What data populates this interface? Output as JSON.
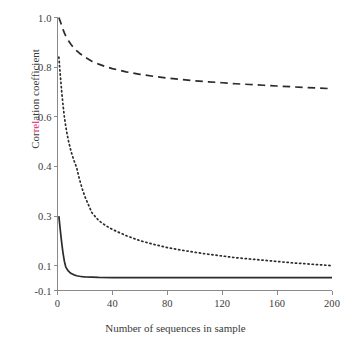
{
  "chart_data": {
    "type": "line",
    "title": "",
    "xlabel": "Number of sequences in sample",
    "ylabel": "Correlation coefficient",
    "ylabel_tinted_fragment": "rel",
    "tint_color": "#d6246e",
    "line_color": "#2b2b2b",
    "axis_color": "#8a8a8a",
    "background": "#ffffff",
    "grid": false,
    "legend": "none",
    "xlim": [
      0,
      200
    ],
    "ylim": [
      -0.1,
      1.0
    ],
    "xticks": [
      0,
      40,
      80,
      120,
      160,
      200
    ],
    "xtick_labels": [
      "0",
      "40",
      "80",
      "120",
      "160",
      "200"
    ],
    "yticks": [
      1.0,
      0.8,
      0.6,
      0.4,
      0.3,
      0.1,
      -0.1
    ],
    "ytick_labels": [
      "1.0",
      "0.8",
      "0.6",
      "0.4",
      "0.3",
      "0.1",
      "-0.1"
    ],
    "ytick_fractions": [
      1.0,
      0.8181818,
      0.6363636,
      0.4545455,
      0.2727273,
      0.0909091,
      0.0
    ],
    "series": [
      {
        "name": "dashed-curve",
        "style": "dashed",
        "x": [
          1,
          2,
          3,
          4,
          5,
          6,
          8,
          10,
          13,
          16,
          20,
          25,
          30,
          35,
          40,
          50,
          60,
          70,
          80,
          90,
          100,
          110,
          120,
          130,
          140,
          150,
          160,
          170,
          180,
          190,
          200
        ],
        "y": [
          1.0,
          0.985,
          0.968,
          0.952,
          0.938,
          0.926,
          0.906,
          0.89,
          0.871,
          0.856,
          0.84,
          0.824,
          0.812,
          0.802,
          0.794,
          0.781,
          0.771,
          0.763,
          0.756,
          0.75,
          0.745,
          0.741,
          0.737,
          0.733,
          0.73,
          0.727,
          0.724,
          0.721,
          0.718,
          0.716,
          0.713
        ]
      },
      {
        "name": "dotted-curve",
        "style": "dotted",
        "x": [
          1,
          2,
          3,
          4,
          5,
          6,
          7,
          8,
          10,
          12,
          14,
          16,
          18,
          20,
          25,
          30,
          35,
          40,
          50,
          60,
          70,
          80,
          90,
          100,
          110,
          120,
          130,
          140,
          150,
          160,
          170,
          180,
          190,
          200
        ],
        "y": [
          0.84,
          0.77,
          0.705,
          0.648,
          0.6,
          0.562,
          0.53,
          0.503,
          0.458,
          0.424,
          0.397,
          0.374,
          0.355,
          0.339,
          0.307,
          0.282,
          0.262,
          0.246,
          0.221,
          0.201,
          0.186,
          0.173,
          0.163,
          0.154,
          0.146,
          0.139,
          0.132,
          0.127,
          0.122,
          0.117,
          0.112,
          0.108,
          0.104,
          0.1
        ]
      },
      {
        "name": "solid-curve",
        "style": "solid",
        "x": [
          1,
          2,
          3,
          4,
          5,
          6,
          7,
          8,
          9,
          10,
          12,
          14,
          16,
          18,
          20,
          25,
          30,
          40,
          60,
          80,
          100,
          120,
          140,
          160,
          180,
          200
        ],
        "y": [
          0.3,
          0.245,
          0.195,
          0.152,
          0.118,
          0.091,
          0.071,
          0.056,
          0.045,
          0.037,
          0.026,
          0.019,
          0.015,
          0.012,
          0.01,
          0.007,
          0.005,
          0.004,
          0.003,
          0.003,
          0.003,
          0.003,
          0.003,
          0.003,
          0.003,
          0.003
        ]
      }
    ]
  }
}
